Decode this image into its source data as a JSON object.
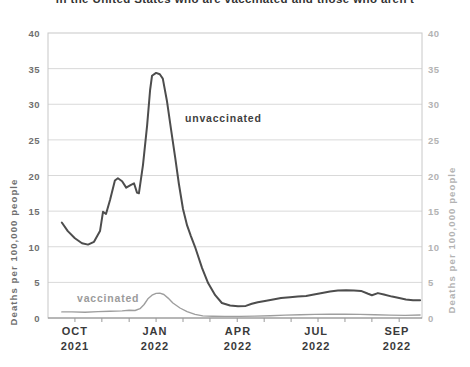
{
  "title": {
    "visible_text": "in the United States who are vaccinated and those who aren't"
  },
  "chart_data": {
    "type": "line",
    "ylabel": "Deaths per 100,000 people",
    "ylabel_right": "Deaths per 100,000 people",
    "xlabel": "",
    "x_unit": "fraction of x-axis, Sep 2021 through Sep 2022",
    "ylim": [
      0,
      40
    ],
    "grid": "horizontal",
    "y_ticks": [
      0,
      5,
      10,
      15,
      20,
      25,
      30,
      35,
      40
    ],
    "y_gridlines": [
      5,
      10,
      15,
      20,
      25,
      30,
      35
    ],
    "x_ticks": [
      {
        "label": "OCT",
        "year": "2021",
        "frac": 0.072
      },
      {
        "label": "JAN",
        "year": "2022",
        "frac": 0.286
      },
      {
        "label": "APR",
        "year": "2022",
        "frac": 0.508
      },
      {
        "label": "JUL",
        "year": "2022",
        "frac": 0.717
      },
      {
        "label": "SEP",
        "year": "2022",
        "frac": 0.933
      }
    ],
    "x_minor_tick_fracs": [
      0.072,
      0.144,
      0.217,
      0.289,
      0.361,
      0.433,
      0.506,
      0.578,
      0.65,
      0.722,
      0.794,
      0.866,
      0.939
    ],
    "colors": {
      "unvaccinated_line": "#4d4d4d",
      "vaccinated_line": "#9e9e9e",
      "gridline": "#d9d9d9",
      "plot_border": "#c8c8c8",
      "axis_line": "#8a8a8a",
      "tick_mark": "#9a9a9a",
      "left_axis_text": "#6f6f6f",
      "right_axis_text": "#b3b3b3",
      "x_axis_text": "#3a3a3a"
    },
    "annotations": [
      {
        "text": "unvaccinated",
        "color": "#3f3f3f"
      },
      {
        "text": "vaccinated",
        "color": "#9b9b9b"
      }
    ],
    "series": [
      {
        "name": "unvaccinated",
        "color": "#4d4d4d",
        "stroke_width": 2,
        "points": [
          [
            0.037,
            13.4
          ],
          [
            0.053,
            12.2
          ],
          [
            0.072,
            11.2
          ],
          [
            0.091,
            10.5
          ],
          [
            0.107,
            10.3
          ],
          [
            0.123,
            10.7
          ],
          [
            0.139,
            12.2
          ],
          [
            0.147,
            14.9
          ],
          [
            0.155,
            14.6
          ],
          [
            0.166,
            16.6
          ],
          [
            0.179,
            19.3
          ],
          [
            0.187,
            19.6
          ],
          [
            0.198,
            19.2
          ],
          [
            0.209,
            18.3
          ],
          [
            0.222,
            18.7
          ],
          [
            0.23,
            18.9
          ],
          [
            0.238,
            17.6
          ],
          [
            0.243,
            17.5
          ],
          [
            0.254,
            21.5
          ],
          [
            0.265,
            27.0
          ],
          [
            0.273,
            32.0
          ],
          [
            0.278,
            34.0
          ],
          [
            0.289,
            34.4
          ],
          [
            0.299,
            34.2
          ],
          [
            0.307,
            33.6
          ],
          [
            0.318,
            30.5
          ],
          [
            0.329,
            26.5
          ],
          [
            0.34,
            22.5
          ],
          [
            0.35,
            18.8
          ],
          [
            0.361,
            15.3
          ],
          [
            0.372,
            13.0
          ],
          [
            0.382,
            11.5
          ],
          [
            0.393,
            10.0
          ],
          [
            0.412,
            7.0
          ],
          [
            0.428,
            4.9
          ],
          [
            0.447,
            3.2
          ],
          [
            0.465,
            2.1
          ],
          [
            0.487,
            1.75
          ],
          [
            0.508,
            1.65
          ],
          [
            0.529,
            1.7
          ],
          [
            0.545,
            2.0
          ],
          [
            0.561,
            2.2
          ],
          [
            0.58,
            2.4
          ],
          [
            0.602,
            2.6
          ],
          [
            0.623,
            2.8
          ],
          [
            0.647,
            2.9
          ],
          [
            0.668,
            3.0
          ],
          [
            0.69,
            3.1
          ],
          [
            0.711,
            3.3
          ],
          [
            0.733,
            3.5
          ],
          [
            0.754,
            3.7
          ],
          [
            0.775,
            3.85
          ],
          [
            0.797,
            3.9
          ],
          [
            0.818,
            3.85
          ],
          [
            0.837,
            3.8
          ],
          [
            0.856,
            3.4
          ],
          [
            0.866,
            3.2
          ],
          [
            0.882,
            3.5
          ],
          [
            0.898,
            3.3
          ],
          [
            0.92,
            3.0
          ],
          [
            0.939,
            2.8
          ],
          [
            0.957,
            2.6
          ],
          [
            0.976,
            2.5
          ],
          [
            0.995,
            2.5
          ]
        ]
      },
      {
        "name": "vaccinated",
        "color": "#9e9e9e",
        "stroke_width": 1.4,
        "points": [
          [
            0.037,
            0.85
          ],
          [
            0.064,
            0.85
          ],
          [
            0.099,
            0.8
          ],
          [
            0.134,
            0.9
          ],
          [
            0.166,
            0.95
          ],
          [
            0.198,
            1.0
          ],
          [
            0.217,
            1.1
          ],
          [
            0.233,
            1.05
          ],
          [
            0.246,
            1.3
          ],
          [
            0.257,
            1.9
          ],
          [
            0.267,
            2.7
          ],
          [
            0.278,
            3.2
          ],
          [
            0.289,
            3.45
          ],
          [
            0.299,
            3.5
          ],
          [
            0.31,
            3.3
          ],
          [
            0.321,
            2.8
          ],
          [
            0.334,
            2.1
          ],
          [
            0.353,
            1.4
          ],
          [
            0.372,
            0.9
          ],
          [
            0.393,
            0.5
          ],
          [
            0.414,
            0.3
          ],
          [
            0.439,
            0.25
          ],
          [
            0.473,
            0.22
          ],
          [
            0.513,
            0.22
          ],
          [
            0.553,
            0.27
          ],
          [
            0.594,
            0.32
          ],
          [
            0.634,
            0.4
          ],
          [
            0.674,
            0.45
          ],
          [
            0.714,
            0.5
          ],
          [
            0.754,
            0.52
          ],
          [
            0.794,
            0.52
          ],
          [
            0.834,
            0.5
          ],
          [
            0.874,
            0.45
          ],
          [
            0.914,
            0.4
          ],
          [
            0.955,
            0.37
          ],
          [
            0.995,
            0.42
          ]
        ]
      }
    ]
  }
}
